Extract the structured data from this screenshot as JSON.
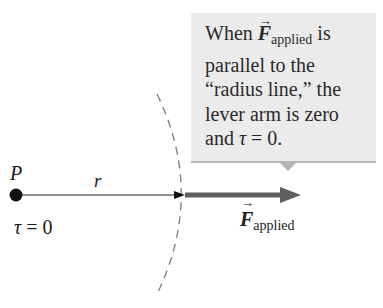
{
  "callout": {
    "line1_prefix": "When ",
    "line1_vector": "F",
    "line1_subscript": "applied",
    "line1_suffix": " is",
    "line2": "parallel to the",
    "line3": "“radius line,” the",
    "line4": "lever arm is zero",
    "line5_prefix": "and ",
    "line5_tau": "τ",
    "line5_suffix": " = 0."
  },
  "labels": {
    "point": "P",
    "radius": "r",
    "torque_tau": "τ",
    "torque_value": " = 0",
    "force_vector": "F",
    "force_subscript": "applied",
    "vector_arrow": "→"
  },
  "colors": {
    "callout_bg": "#ebebeb",
    "callout_border": "#b5b5b5",
    "force_arrow": "#5f5f5f",
    "radius_line": "#6e6e6e",
    "dashed_arc": "#7a7a7a",
    "point": "#111111"
  }
}
